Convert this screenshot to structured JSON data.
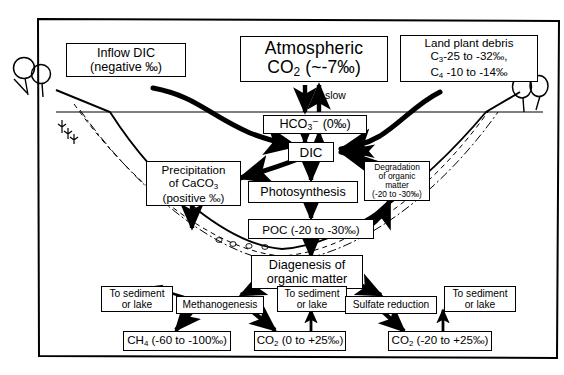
{
  "figure": {
    "frame_color": "#000000",
    "background_color": "#ffffff"
  },
  "labels": {
    "slow": "slow"
  },
  "nodes": {
    "inflow_dic": {
      "line1": "Inflow DIC",
      "line2": "(negative ‰)"
    },
    "atmospheric_co2": {
      "line1": "Atmospheric",
      "line2_pre": "CO",
      "line2_sub": "2",
      "line2_post": " (~-7‰)"
    },
    "land_plant_debris": {
      "line1": "Land plant debris",
      "line2_pre": "C",
      "line2_sub": "3",
      "line2_post": "-25 to -32‰,",
      "line3_pre": "C",
      "line3_sub": "4",
      "line3_post": " -10 to -14‰"
    },
    "bicarbonate": {
      "pre": "HCO",
      "sub": "3",
      "post": "⁻  (0‰)"
    },
    "dic": {
      "label": "DIC"
    },
    "precipitation_caco3": {
      "line1": "Precipitation",
      "line2_pre": "of CaCO",
      "line2_sub": "3",
      "line3": "(positive ‰)"
    },
    "photosynthesis": {
      "label": "Photosynthesis"
    },
    "degradation": {
      "line1": "Degradation",
      "line2": "of organic",
      "line3": "matter",
      "line4": "(-20 to -30‰)"
    },
    "poc": {
      "label": "POC (-20 to -30‰)"
    },
    "diagenesis": {
      "line1": "Diagenesis of",
      "line2": "organic matter"
    },
    "to_sediment_left": {
      "line1": "To sediment",
      "line2": "or lake"
    },
    "methanogenesis": {
      "label": "Methanogenesis"
    },
    "to_sediment_mid": {
      "line1": "To sediment",
      "line2": "or lake"
    },
    "sulfate_reduction": {
      "label": "Sulfate reduction"
    },
    "to_sediment_right": {
      "line1": "To sediment",
      "line2": "or lake"
    },
    "methane": {
      "pre": "CH",
      "sub": "4",
      "post": " (-60 to -100‰)"
    },
    "co2_methanogenesis": {
      "pre": "CO",
      "sub": "2",
      "post": " (0 to +25‰)"
    },
    "co2_sulfate": {
      "pre": "CO",
      "sub": "2",
      "post": " (-20 to +25‰)"
    }
  }
}
